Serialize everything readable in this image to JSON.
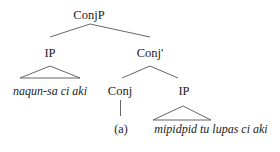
{
  "diagram": {
    "type": "syntax-tree",
    "nodes": {
      "root": {
        "label": "ConjP"
      },
      "left_ip": {
        "label": "IP",
        "leaf": "naqun-sa ci aki"
      },
      "conj_bar": {
        "label": "Conj'"
      },
      "conj": {
        "label": "Conj",
        "leaf": "(a)"
      },
      "right_ip": {
        "label": "IP",
        "leaf": "mipidpid tu lupas ci aki"
      }
    },
    "edges": [
      [
        "ConjP",
        "IP"
      ],
      [
        "ConjP",
        "Conj'"
      ],
      [
        "Conj'",
        "Conj"
      ],
      [
        "Conj'",
        "IP"
      ],
      [
        "Conj",
        "(a)"
      ]
    ],
    "triangles": [
      {
        "over": "naqun-sa ci aki"
      },
      {
        "over": "mipidpid tu lupas ci aki"
      }
    ],
    "colors": {
      "text": "#222222",
      "line": "#555555",
      "background": "#ffffff"
    }
  }
}
